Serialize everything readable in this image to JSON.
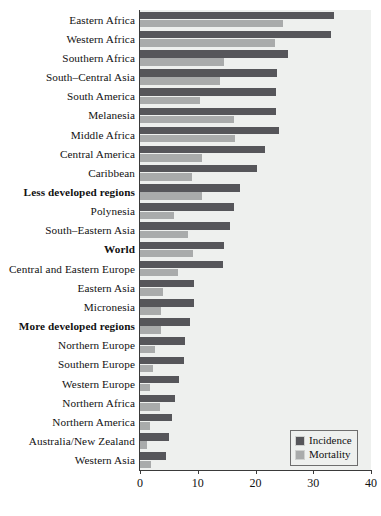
{
  "chart_data": {
    "type": "bar",
    "orientation": "horizontal",
    "title": "",
    "xlabel": "",
    "ylabel": "",
    "xlim": [
      0,
      40
    ],
    "xticks": [
      0,
      10,
      20,
      30,
      40
    ],
    "xtick_labels": [
      "0",
      "10",
      "20",
      "30",
      "40"
    ],
    "grid": false,
    "legend_position": "bottom-right",
    "legend": [
      "Incidence",
      "Mortality"
    ],
    "colors": {
      "incidence": "#56565a",
      "mortality": "#a9abab",
      "plot_background": "#eef0ee",
      "axis": "#3a3a3a"
    },
    "categories": [
      "Eastern Africa",
      "Western Africa",
      "Southern Africa",
      "South–Central Asia",
      "South America",
      "Melanesia",
      "Middle Africa",
      "Central America",
      "Caribbean",
      "Less developed regions",
      "Polynesia",
      "South–Eastern Asia",
      "World",
      "Central and Eastern Europe",
      "Eastern Asia",
      "Micronesia",
      "More developed regions",
      "Northern Europe",
      "Southern Europe",
      "Western Europe",
      "Northern Africa",
      "Northern America",
      "Australia/New Zealand",
      "Western Asia"
    ],
    "emphasized_categories": [
      "Less developed regions",
      "World",
      "More developed regions"
    ],
    "series": [
      {
        "name": "Incidence",
        "values": [
          33.6,
          33.0,
          25.7,
          23.8,
          23.5,
          23.5,
          24.0,
          21.7,
          20.2,
          17.4,
          16.2,
          15.6,
          14.6,
          14.4,
          9.4,
          9.4,
          8.7,
          7.8,
          7.7,
          6.8,
          6.1,
          5.6,
          5.1,
          4.5
        ]
      },
      {
        "name": "Mortality",
        "values": [
          24.7,
          23.3,
          14.6,
          13.9,
          10.4,
          16.3,
          16.5,
          10.8,
          9.0,
          10.8,
          5.9,
          8.3,
          9.2,
          6.6,
          4.0,
          3.7,
          3.7,
          2.6,
          2.3,
          1.7,
          3.5,
          1.7,
          1.2,
          1.9
        ]
      }
    ]
  }
}
